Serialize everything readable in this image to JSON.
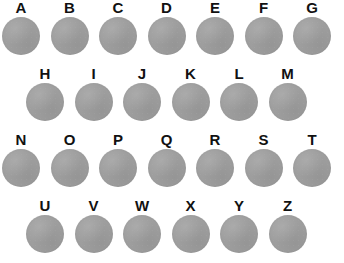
{
  "page": {
    "background_color": "#ffffff",
    "width": 344,
    "height": 263
  },
  "style": {
    "disc_color": "#9e9e9e",
    "label_color": "#111111",
    "disc_diameter_px": 38,
    "column_pitch_px": 48.5,
    "row_pitch_px": 66
  },
  "grid": {
    "item_count": 26,
    "row_count": 4,
    "layout": "staggered",
    "rows": [
      {
        "row_index": 0,
        "offset_x": 2,
        "offset_y": 0,
        "items": [
          {
            "label": "A",
            "shape": "circle",
            "fill": "#9e9e9e"
          },
          {
            "label": "B",
            "shape": "circle",
            "fill": "#9e9e9e"
          },
          {
            "label": "C",
            "shape": "circle",
            "fill": "#9e9e9e"
          },
          {
            "label": "D",
            "shape": "circle",
            "fill": "#9e9e9e"
          },
          {
            "label": "E",
            "shape": "circle",
            "fill": "#9e9e9e"
          },
          {
            "label": "F",
            "shape": "circle",
            "fill": "#9e9e9e"
          },
          {
            "label": "G",
            "shape": "circle",
            "fill": "#9e9e9e"
          }
        ]
      },
      {
        "row_index": 1,
        "offset_x": 26,
        "offset_y": 66,
        "items": [
          {
            "label": "H",
            "shape": "circle",
            "fill": "#9e9e9e"
          },
          {
            "label": "I",
            "shape": "circle",
            "fill": "#9e9e9e"
          },
          {
            "label": "J",
            "shape": "circle",
            "fill": "#9e9e9e"
          },
          {
            "label": "K",
            "shape": "circle",
            "fill": "#9e9e9e"
          },
          {
            "label": "L",
            "shape": "circle",
            "fill": "#9e9e9e"
          },
          {
            "label": "M",
            "shape": "circle",
            "fill": "#9e9e9e"
          }
        ]
      },
      {
        "row_index": 2,
        "offset_x": 2,
        "offset_y": 132,
        "items": [
          {
            "label": "N",
            "shape": "circle",
            "fill": "#9e9e9e"
          },
          {
            "label": "O",
            "shape": "circle",
            "fill": "#9e9e9e"
          },
          {
            "label": "P",
            "shape": "circle",
            "fill": "#9e9e9e"
          },
          {
            "label": "Q",
            "shape": "circle",
            "fill": "#9e9e9e"
          },
          {
            "label": "R",
            "shape": "circle",
            "fill": "#9e9e9e"
          },
          {
            "label": "S",
            "shape": "circle",
            "fill": "#9e9e9e"
          },
          {
            "label": "T",
            "shape": "circle",
            "fill": "#9e9e9e"
          }
        ]
      },
      {
        "row_index": 3,
        "offset_x": 26,
        "offset_y": 198,
        "items": [
          {
            "label": "U",
            "shape": "circle",
            "fill": "#9e9e9e"
          },
          {
            "label": "V",
            "shape": "circle",
            "fill": "#9e9e9e"
          },
          {
            "label": "W",
            "shape": "circle",
            "fill": "#9e9e9e"
          },
          {
            "label": "X",
            "shape": "circle",
            "fill": "#9e9e9e"
          },
          {
            "label": "Y",
            "shape": "circle",
            "fill": "#9e9e9e"
          },
          {
            "label": "Z",
            "shape": "circle",
            "fill": "#9e9e9e"
          }
        ]
      }
    ]
  }
}
